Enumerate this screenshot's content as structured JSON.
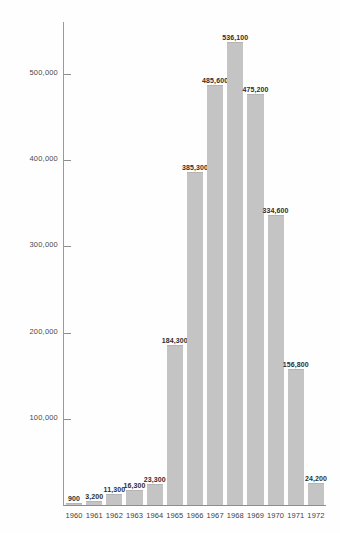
{
  "chart_data": {
    "type": "bar",
    "title": "",
    "xlabel": "",
    "ylabel": "",
    "categories": [
      "1960",
      "1961",
      "1962",
      "1963",
      "1964",
      "1965",
      "1966",
      "1967",
      "1968",
      "1969",
      "1970",
      "1971",
      "1972"
    ],
    "values": [
      900,
      3200,
      11300,
      16300,
      23300,
      184300,
      385300,
      485600,
      536100,
      475200,
      334600,
      156800,
      24200
    ],
    "value_labels": [
      "900",
      "3,200",
      "11,300",
      "16,300",
      "23,300",
      "184,300",
      "385,300",
      "485,600",
      "536,100",
      "475,200",
      "334,600",
      "156,800",
      "24,200"
    ],
    "ylim": [
      0,
      560000
    ],
    "y_ticks": [
      100000,
      200000,
      300000,
      400000,
      500000
    ],
    "y_tick_labels": [
      "100,000",
      "200,000",
      "300,000",
      "400,000",
      "500,000"
    ],
    "grid": false,
    "legend": null,
    "bar_color": "#c4c4c4",
    "axis_color": "#8e8e8e",
    "background_color": "#ffffff"
  }
}
